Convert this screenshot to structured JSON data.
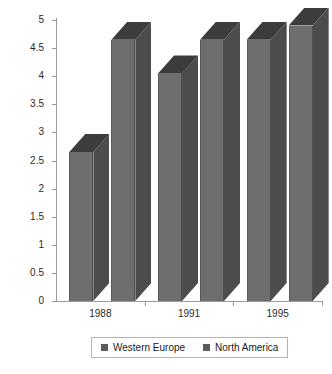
{
  "chart_data": {
    "type": "bar",
    "title": "",
    "subtitle": "",
    "xlabel": "",
    "ylabel": "",
    "categories": [
      "1988",
      "1991",
      "1995"
    ],
    "series": [
      {
        "name": "Western Europe",
        "values": [
          2.65,
          4.05,
          4.65
        ],
        "color": "#6e6e6e"
      },
      {
        "name": "North America",
        "values": [
          4.65,
          4.65,
          4.9
        ],
        "color": "#6e6e6e"
      }
    ],
    "ylim": [
      0,
      5
    ],
    "ytick_step": 0.5,
    "ytick_labels": [
      "5",
      "4.5",
      "4",
      "3.5",
      "3",
      "2.5",
      "2",
      "1.5",
      "1",
      "0.5",
      "0"
    ],
    "grid": false,
    "three_d": true,
    "legend_position": "bottom"
  },
  "axes": {
    "y_ticks": [
      {
        "label": "5",
        "value": 5
      },
      {
        "label": "4.5",
        "value": 4.5
      },
      {
        "label": "4",
        "value": 4
      },
      {
        "label": "3.5",
        "value": 3.5
      },
      {
        "label": "3",
        "value": 3
      },
      {
        "label": "2.5",
        "value": 2.5
      },
      {
        "label": "2",
        "value": 2
      },
      {
        "label": "1.5",
        "value": 1.5
      },
      {
        "label": "1",
        "value": 1
      },
      {
        "label": "0.5",
        "value": 0.5
      },
      {
        "label": "0",
        "value": 0
      }
    ],
    "x_ticks": [
      {
        "label": "1988"
      },
      {
        "label": "1991"
      },
      {
        "label": "1995"
      }
    ]
  },
  "legend": {
    "items": [
      {
        "label": "Western Europe",
        "color": "#5c5c5c"
      },
      {
        "label": "North America",
        "color": "#5c5c5c"
      }
    ]
  },
  "colors": {
    "bar_front": "#6e6e6e",
    "bar_side": "#4c4c4c",
    "bar_top": "#3c3c3c",
    "axis": "#9a9a9a",
    "text": "#1a1a1a",
    "background": "#ffffff",
    "legend_border": "#b4b4b4"
  }
}
